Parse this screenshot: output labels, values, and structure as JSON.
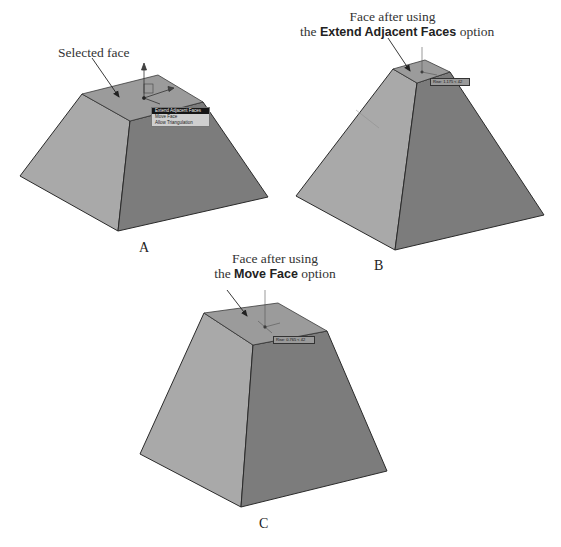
{
  "figure": {
    "panels": [
      {
        "id": "A",
        "label": "A",
        "callout": {
          "line1": "Selected face",
          "line2_prefix": "",
          "line2_bold": "",
          "line2_suffix": ""
        },
        "context_menu": {
          "items": [
            {
              "label": "Extend Adjacent Faces",
              "selected": true
            },
            {
              "label": "Move Face",
              "selected": false
            },
            {
              "label": "Allow Triangulation",
              "selected": false
            }
          ]
        }
      },
      {
        "id": "B",
        "label": "B",
        "callout": {
          "line1": "Face after using",
          "line2_prefix": "the ",
          "line2_bold": "Extend Adjacent Faces",
          "line2_suffix": " option"
        },
        "tooltip": "Rise: 1.175 < 42"
      },
      {
        "id": "C",
        "label": "C",
        "callout": {
          "line1": "Face after using",
          "line2_prefix": "the ",
          "line2_bold": "Move Face",
          "line2_suffix": " option"
        },
        "tooltip": "Rise: 0.765 < 42"
      }
    ],
    "colors": {
      "top_face": "#9d9d9d",
      "left_face": "#a8a8a8",
      "right_face": "#7a7a7a",
      "edge": "#2a2a2a",
      "menu_bg": "#cfcfcf",
      "menu_selected_bg": "#151515",
      "tooltip_bg": "#9a9a9a"
    }
  }
}
